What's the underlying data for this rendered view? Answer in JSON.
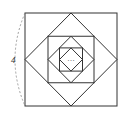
{
  "figure": {
    "side_label": "4",
    "center_ellipsis": "…",
    "stroke_color": "#333333",
    "dash_color": "#888888",
    "outer_square": {
      "x": 25,
      "y": 13,
      "size": 93
    },
    "levels": 3
  }
}
